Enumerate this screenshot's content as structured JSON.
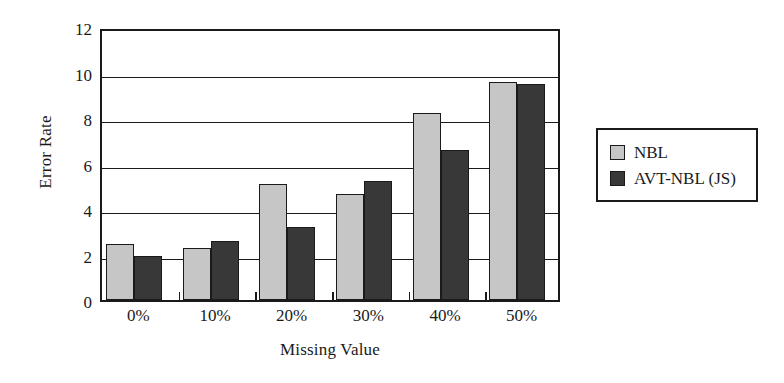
{
  "chart_data": {
    "type": "bar",
    "title": "",
    "xlabel": "Missing Value",
    "ylabel": "Error Rate",
    "categories": [
      "0%",
      "10%",
      "20%",
      "30%",
      "40%",
      "50%"
    ],
    "series": [
      {
        "name": "NBL",
        "color": "#c6c6c6",
        "values": [
          2.45,
          2.3,
          5.1,
          4.65,
          8.2,
          9.6
        ]
      },
      {
        "name": "AVT-NBL (JS)",
        "color": "#383838",
        "values": [
          1.95,
          2.6,
          3.2,
          5.25,
          6.6,
          9.5
        ]
      }
    ],
    "ylim": [
      0,
      12
    ],
    "yticks": [
      "0",
      "2",
      "4",
      "6",
      "8",
      "10",
      "12"
    ],
    "ytick_values": [
      0,
      2,
      4,
      6,
      8,
      10,
      12
    ],
    "grid": true,
    "legend_position": "right-outside",
    "axis_color": "#1a1a1a",
    "background": "#ffffff"
  },
  "legend": {
    "entries": [
      {
        "label": "NBL",
        "swatch": "legend-swatch-nbl"
      },
      {
        "label": "AVT-NBL (JS)",
        "swatch": "legend-swatch-avt-nbl-js"
      }
    ]
  }
}
